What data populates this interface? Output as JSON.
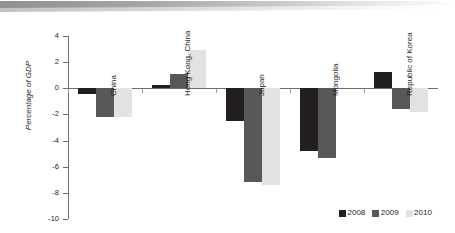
{
  "banner": {
    "name": "decorative-header-band"
  },
  "chart_data": {
    "type": "bar",
    "title": "",
    "subtitle": "",
    "xlabel": "",
    "ylabel": "Percentage of GDP",
    "ylim": [
      -10,
      4
    ],
    "yticks": [
      4,
      2,
      0,
      -2,
      -4,
      -6,
      -8,
      -10
    ],
    "ytick_labels": [
      "4",
      "2",
      "0",
      "-2",
      "-4",
      "-6",
      "-8",
      "-10"
    ],
    "grid": false,
    "legend_position": "bottom-right",
    "categories": [
      "China",
      "Hong Kong, China",
      "Japan",
      "Mongolia",
      "Republic of Korea"
    ],
    "series": [
      {
        "name": "2008",
        "color": "#231f20",
        "values": [
          -0.4,
          0.25,
          -2.5,
          -4.8,
          1.25
        ]
      },
      {
        "name": "2009",
        "color": "#58585a",
        "values": [
          -2.2,
          1.1,
          -7.2,
          -5.3,
          -1.6
        ]
      },
      {
        "name": "2010",
        "color": "#e2e2e2",
        "values": [
          -2.2,
          2.9,
          -7.4,
          null,
          -1.8
        ]
      }
    ]
  },
  "legend": {
    "items": [
      {
        "label": "2008",
        "color": "#231f20"
      },
      {
        "label": "2009",
        "color": "#58585a"
      },
      {
        "label": "2010",
        "color": "#e2e2e2"
      }
    ]
  },
  "axis": {
    "y_title": "Percentage of GDP",
    "ticks": [
      {
        "label": "4",
        "value": 4
      },
      {
        "label": "2",
        "value": 2
      },
      {
        "label": "0",
        "value": 0
      },
      {
        "label": "-2",
        "value": -2
      },
      {
        "label": "-4",
        "value": -4
      },
      {
        "label": "-6",
        "value": -6
      },
      {
        "label": "-8",
        "value": -8
      },
      {
        "label": "-10",
        "value": -10
      }
    ]
  }
}
